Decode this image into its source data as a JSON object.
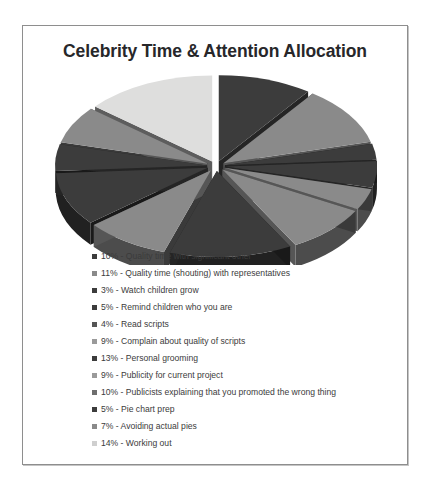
{
  "chart_title": "Celebrity Time & Attention Allocation",
  "colors": {
    "background": "#ffffff",
    "frame_border": "#8e8e8e",
    "title_text": "#27272a",
    "legend_text": "#3b3b3b",
    "dark_slice": "#3c3c3c",
    "mid_slice": "#8a8a8a",
    "light_slice": "#c9c9c9",
    "pale_slice": "#dededd",
    "dark_wall": "#1e1e1e",
    "mid_wall": "#4a4a4a"
  },
  "chart_data": {
    "type": "pie",
    "title": "Celebrity Time & Attention Allocation",
    "xlabel": "",
    "ylabel": "",
    "exploded": true,
    "three_d": true,
    "legend_position": "bottom",
    "grid": false,
    "units": "percent",
    "categories": [
      "Quality time with significant other",
      "Quality time (shouting) with representatives",
      "Watch children grow",
      "Remind children who you are",
      "Read scripts",
      "Complain about quality of scripts",
      "Personal grooming",
      "Publicity for current project",
      "Publicists explaining that you promoted the wrong thing",
      "Pie chart prep",
      "Avoiding actual pies",
      "Working out"
    ],
    "values": [
      10,
      11,
      3,
      5,
      4,
      9,
      13,
      9,
      10,
      5,
      7,
      14
    ],
    "slice_colors": [
      "#3c3c3c",
      "#8a8a8a",
      "#3c3c3c",
      "#3c3c3c",
      "#8a8a8a",
      "#8a8a8a",
      "#3c3c3c",
      "#8a8a8a",
      "#3c3c3c",
      "#3c3c3c",
      "#8a8a8a",
      "#dededd"
    ],
    "legend": [
      {
        "percent": "10%",
        "label": "Quality time with significant other",
        "text": "10% - Quality time with significant other",
        "swatch": "#3c3c3c"
      },
      {
        "percent": "11%",
        "label": "Quality time (shouting) with representatives",
        "text": "11% - Quality time (shouting) with representatives",
        "swatch": "#8a8a8a"
      },
      {
        "percent": "3%",
        "label": "Watch children grow",
        "text": "3% - Watch children grow",
        "swatch": "#3c3c3c"
      },
      {
        "percent": "5%",
        "label": "Remind children who you are",
        "text": "5% - Remind children who you are",
        "swatch": "#3c3c3c"
      },
      {
        "percent": "4%",
        "label": "Read scripts",
        "text": "4% - Read scripts",
        "swatch": "#555555"
      },
      {
        "percent": "9%",
        "label": "Complain about quality of scripts",
        "text": "9% - Complain about quality of scripts",
        "swatch": "#9a9a9a"
      },
      {
        "percent": "13%",
        "label": "Personal grooming",
        "text": "13% - Personal grooming",
        "swatch": "#3c3c3c"
      },
      {
        "percent": "9%",
        "label": "Publicity for current project",
        "text": "9% - Publicity for current project",
        "swatch": "#9a9a9a"
      },
      {
        "percent": "10%",
        "label": "Publicists explaining that you promoted the wrong thing",
        "text": "10% - Publicists explaining that you promoted the wrong thing",
        "swatch": "#6e6e6e"
      },
      {
        "percent": "5%",
        "label": "Pie chart prep",
        "text": "5% - Pie chart prep",
        "swatch": "#3c3c3c"
      },
      {
        "percent": "7%",
        "label": "Avoiding actual pies",
        "text": "7% - Avoiding actual pies",
        "swatch": "#8a8a8a"
      },
      {
        "percent": "14%",
        "label": "Working out",
        "text": "14% - Working out",
        "swatch": "#cfcfcf"
      }
    ]
  }
}
